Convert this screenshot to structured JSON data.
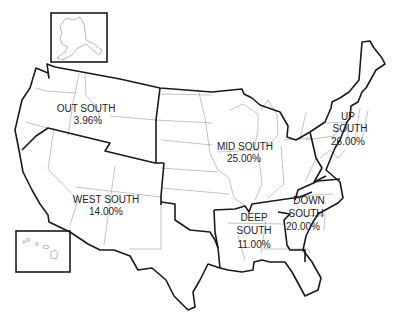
{
  "map": {
    "title": "",
    "insets": [
      {
        "name": "Alaska",
        "icon": "alaska-outline"
      },
      {
        "name": "Hawaii",
        "icon": "hawaii-islands"
      }
    ],
    "regions": [
      {
        "id": "out-south",
        "line1": "OUT SOUTH",
        "line2": "3.96%",
        "value": 3.96
      },
      {
        "id": "mid-south",
        "line1": "MID SOUTH",
        "line2": "25.00%",
        "value": 25.0
      },
      {
        "id": "up-south",
        "line1": "UP",
        "line2": "SOUTH",
        "line3": "26.00%",
        "value": 26.0
      },
      {
        "id": "west-south",
        "line1": "WEST SOUTH",
        "line2": "14.00%",
        "value": 14.0
      },
      {
        "id": "deep-south",
        "line1": "DEEP",
        "line2": "SOUTH",
        "line3": "11.00%",
        "value": 11.0
      },
      {
        "id": "down-south",
        "line1": "DOWN",
        "line2": "SOUTH",
        "line3": "20.00%",
        "value": 20.0
      }
    ],
    "colors": {
      "region_border": "#1a1a1a",
      "state_border": "#9a9a9a",
      "background": "#ffffff",
      "label": "#222222"
    }
  }
}
